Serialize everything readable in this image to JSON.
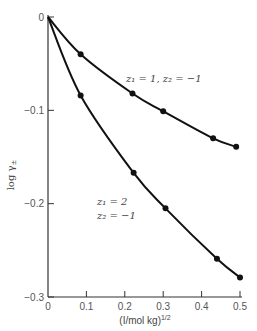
{
  "chart_data": {
    "type": "line",
    "title": "",
    "xlabel": "(I/mol kg)^1/2",
    "ylabel": "log γ±",
    "xlim": [
      0,
      0.5
    ],
    "ylim": [
      -0.3,
      0
    ],
    "grid": false,
    "x_ticks": [
      "0",
      "0.1",
      "0.2",
      "0.3",
      "0.4",
      "0.5"
    ],
    "y_ticks": [
      "0",
      "-0.1",
      "-0.2",
      "-0.3"
    ],
    "series": [
      {
        "name": "z1 = 1, z2 = -1",
        "x": [
          0,
          0.085,
          0.22,
          0.3,
          0.43,
          0.49
        ],
        "y": [
          0,
          -0.04,
          -0.082,
          -0.101,
          -0.13,
          -0.139
        ]
      },
      {
        "name": "z1 = 2, z2 = -1",
        "x": [
          0,
          0.085,
          0.223,
          0.306,
          0.44,
          0.5
        ],
        "y": [
          0,
          -0.084,
          -0.167,
          -0.205,
          -0.259,
          -0.279
        ]
      }
    ],
    "annotations": [
      {
        "text": "z1 = 1, z2 = -1",
        "near_series": 0
      },
      {
        "text": "z1 = 2",
        "near_series": 1
      },
      {
        "text": "z2 = -1",
        "near_series": 1
      }
    ]
  },
  "labels": {
    "ylabel_main": "log γ",
    "ylabel_sub": "±",
    "xlabel_main": "(I/mol kg)",
    "xlabel_sup": "1/2",
    "upper_curve_label": "z₁ = 1, z₂ = −1",
    "lower_curve_label_1": "z₁ = 2",
    "lower_curve_label_2": "z₂ = −1",
    "x_ticks": [
      "0",
      "0.1",
      "0.2",
      "0.3",
      "0.4",
      "0.5"
    ],
    "y_ticks": [
      "0",
      "−0.1",
      "−0.2",
      "−0.3"
    ]
  }
}
